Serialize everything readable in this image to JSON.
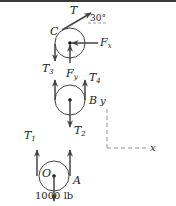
{
  "diagram": {
    "colors": {
      "line": "#333333",
      "arrow": "#444444",
      "axis": "#777777",
      "topbar": "#3a3a3a"
    },
    "pulleys": [
      {
        "name": "C",
        "label": "C"
      },
      {
        "name": "B",
        "label": "B"
      },
      {
        "name": "O",
        "label": "O"
      }
    ],
    "point_labels": {
      "A": "A"
    },
    "forces": {
      "T": "T",
      "angle": "30°",
      "Fx": "F",
      "Fx_sub": "x",
      "Fy": "F",
      "Fy_sub": "y",
      "T3": "T",
      "T3_sub": "3",
      "T4": "T",
      "T4_sub": "4",
      "T1": "T",
      "T1_sub": "1",
      "T2": "T",
      "T2_sub": "2",
      "load": "1000 lb"
    },
    "axes": {
      "x": "x",
      "y": "y"
    }
  }
}
